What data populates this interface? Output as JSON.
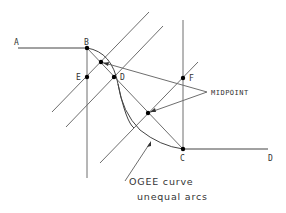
{
  "diagram": {
    "colors": {
      "line": "#6e6e6e",
      "point": "#000000",
      "text": "#333333",
      "background": "#ffffff"
    },
    "points": {
      "A": {
        "label": "A",
        "x": 18,
        "y": 48
      },
      "B": {
        "label": "B",
        "x": 87,
        "y": 48
      },
      "E": {
        "label": "E",
        "x": 87,
        "y": 77
      },
      "D_upper": {
        "label": "D",
        "x": 114,
        "y": 77
      },
      "F": {
        "label": "F",
        "x": 183,
        "y": 78
      },
      "C": {
        "label": "C",
        "x": 183,
        "y": 149
      },
      "D_end": {
        "label": "D",
        "x": 268,
        "y": 149
      },
      "midpoint_1": {
        "x": 101,
        "y": 62
      },
      "midpoint_2": {
        "x": 148,
        "y": 113
      }
    },
    "labels": {
      "A": "A",
      "B": "B",
      "E": "E",
      "D_upper": "D",
      "F": "F",
      "C": "C",
      "D_end": "D",
      "midpoint": "MIDPOINT",
      "curve_line1": "OGEE curve",
      "curve_line2": "unequal arcs"
    }
  }
}
